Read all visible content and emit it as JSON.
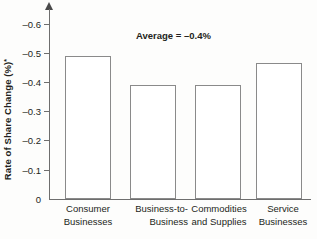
{
  "chart_data": {
    "type": "bar",
    "title": "",
    "xlabel": "",
    "ylabel": "Rate of Share Change (%)",
    "ylabel_superscript": "*",
    "categories": [
      "Consumer Businesses",
      "Business-to-Business",
      "Commodities and Supplies",
      "Service Businesses"
    ],
    "category_lines": [
      [
        "Consumer",
        "Businesses"
      ],
      [
        "Business-to-",
        "Business"
      ],
      [
        "Commodities",
        "and Supplies"
      ],
      [
        "Service",
        "Businesses"
      ]
    ],
    "values": [
      -0.49,
      -0.39,
      -0.39,
      -0.465
    ],
    "ylim": [
      0,
      -0.65
    ],
    "ytick_values": [
      -0.6,
      -0.5,
      -0.4,
      -0.3,
      -0.2,
      -0.1,
      0
    ],
    "ytick_labels": [
      "–0.6",
      "–0.5",
      "–0.4",
      "–0.3",
      "–0.2",
      "–0.1",
      "0"
    ],
    "grid": false,
    "legend": null,
    "annotations": [
      {
        "text": "Average = –0.4%",
        "x": 0.46,
        "y": -0.565
      }
    ],
    "bar_style": {
      "fill": "#ffffff",
      "edge": "#8a8a8a"
    }
  },
  "axis": {
    "tick_color": "#6e6e6e",
    "text_color": "#231f20"
  }
}
